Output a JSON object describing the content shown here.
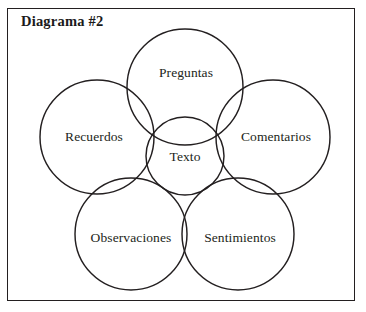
{
  "figure": {
    "title": "Diagrama #2",
    "frame_color": "#231f20",
    "background_color": "#ffffff",
    "stroke_color": "#231f20",
    "width": 366,
    "height": 312
  },
  "diagram": {
    "type": "venn",
    "center_node": {
      "label": "Texto",
      "cx": 185,
      "cy": 156,
      "r": 39,
      "label_x": 185,
      "label_y": 157
    },
    "nodes": [
      {
        "id": "preguntas",
        "label": "Preguntas",
        "cx": 185,
        "cy": 87,
        "r": 58,
        "label_x": 186,
        "label_y": 73
      },
      {
        "id": "recuerdos",
        "label": "Recuerdos",
        "cx": 97,
        "cy": 137,
        "r": 57,
        "label_x": 94,
        "label_y": 137
      },
      {
        "id": "comentarios",
        "label": "Comentarios",
        "cx": 273,
        "cy": 137,
        "r": 57,
        "label_x": 276,
        "label_y": 137
      },
      {
        "id": "observaciones",
        "label": "Observaciones",
        "cx": 131,
        "cy": 234,
        "r": 56,
        "label_x": 131,
        "label_y": 238
      },
      {
        "id": "sentimientos",
        "label": "Sentimientos",
        "cx": 238,
        "cy": 234,
        "r": 56,
        "label_x": 240,
        "label_y": 238
      }
    ]
  }
}
